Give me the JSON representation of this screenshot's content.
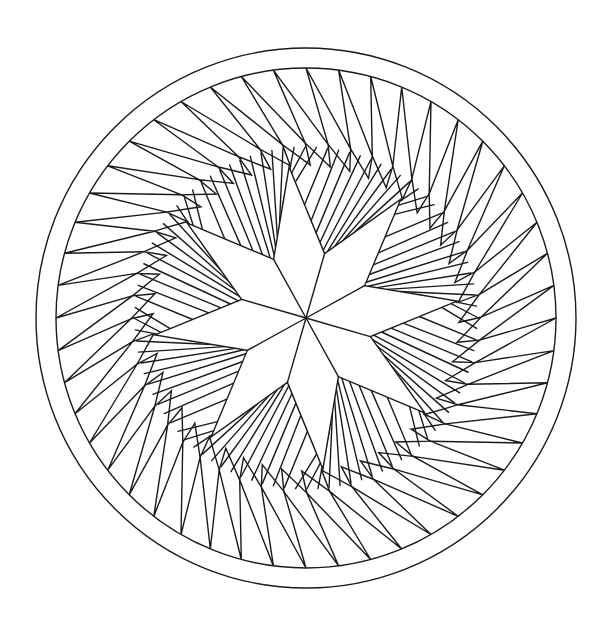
{
  "figure": {
    "title": "",
    "width": 609,
    "height": 631,
    "background": "#ffffff",
    "stroke_color": "#1a1a1a",
    "center": [
      306,
      318
    ],
    "outer_ring": {
      "outer_radius": 270,
      "inner_radius": 250
    },
    "sawtooth_band": {
      "count": 48,
      "apex_radius": 250,
      "base_radius": 175,
      "swirl_offset_deg": 11,
      "rotation_deg": 0
    },
    "radial_fill": {
      "lines_per_sector": 5,
      "inner_notch_radius": 150
    },
    "star": {
      "points": 8,
      "tip_radius": 152,
      "notch_radius": 67,
      "rotation_deg": -96.4
    }
  }
}
